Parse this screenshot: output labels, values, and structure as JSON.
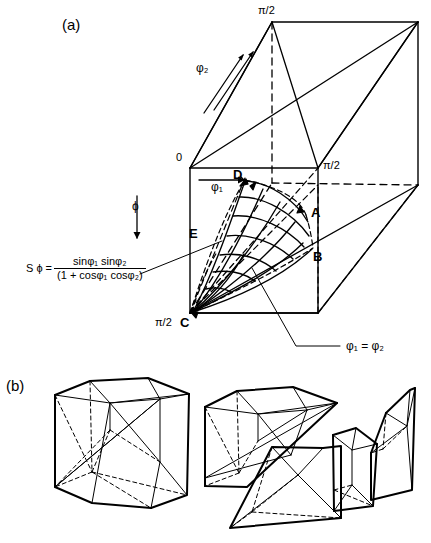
{
  "figure": {
    "panels": [
      {
        "id": "a",
        "label": "(a)"
      },
      {
        "id": "b",
        "label": "(b)"
      }
    ],
    "panel_a": {
      "axes": [
        {
          "name": "phi1",
          "label": "φ₁",
          "direction": "right",
          "arrow": true
        },
        {
          "name": "phi2",
          "label": "φ₂",
          "direction": "up-right-depth",
          "arrow": true
        },
        {
          "name": "phi",
          "label": "ϕ",
          "direction": "down",
          "arrow": true
        }
      ],
      "tick_labels": [
        {
          "name": "origin",
          "text": "0"
        },
        {
          "name": "top-phi2",
          "text": "π/2"
        },
        {
          "name": "right-phi1",
          "text": "π/2"
        },
        {
          "name": "bottom-phi",
          "text": "π/2"
        }
      ],
      "point_labels": [
        {
          "name": "A",
          "text": "A"
        },
        {
          "name": "B",
          "text": "B"
        },
        {
          "name": "C",
          "text": "C"
        },
        {
          "name": "D",
          "text": "D"
        },
        {
          "name": "E",
          "text": "E"
        }
      ],
      "equation": {
        "lhs": "S ϕ =",
        "numerator": "sinφ₁  sinφ₂",
        "denominator": "(1 + cosφ₁  cosφ₂)"
      },
      "diagonal_annotation": {
        "text": "φ₁ = φ₂"
      }
    },
    "panel_b": {
      "pieces": [
        {
          "name": "assembled-cube"
        },
        {
          "name": "exploded-cube-shell"
        },
        {
          "name": "exploded-wedge-front"
        },
        {
          "name": "exploded-wedge-middle"
        },
        {
          "name": "exploded-wedge-right"
        }
      ]
    },
    "colors": {
      "ink": "#000000",
      "background": "#ffffff"
    }
  }
}
